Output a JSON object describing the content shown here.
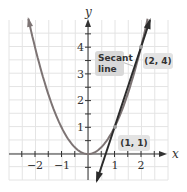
{
  "chart_data": {
    "type": "line",
    "title": "",
    "xlabel": "x",
    "ylabel": "y",
    "xlim": [
      -2.6,
      2.9
    ],
    "ylim": [
      -1.0,
      5.0
    ],
    "x_ticks": [
      -2,
      -1,
      1,
      2
    ],
    "x_tick_labels": [
      "−2",
      "−1",
      "1",
      "2"
    ],
    "y_ticks": [
      1,
      2,
      3,
      4
    ],
    "y_tick_labels": [
      "1",
      "2",
      "3",
      "4"
    ],
    "grid": true,
    "series": [
      {
        "name": "parabola",
        "equation": "y = x^2",
        "x_range": [
          -2.25,
          2.25
        ],
        "color": "#7d7474"
      },
      {
        "name": "secant line",
        "equation": "y = 3x - 2",
        "x_range": [
          0.33,
          2.34
        ],
        "color": "#2b2b2b"
      }
    ],
    "points": [
      {
        "x": 1,
        "y": 1,
        "label": "(1, 1)"
      },
      {
        "x": 2,
        "y": 4,
        "label": "(2, 4)"
      }
    ],
    "annotations": [
      {
        "text": "Secant line",
        "target": "secant line"
      },
      {
        "text": "(2, 4)",
        "target": [
          2,
          4
        ]
      },
      {
        "text": "(1, 1)",
        "target": [
          1,
          1
        ]
      }
    ]
  },
  "labels": {
    "x_axis": "x",
    "y_axis": "y",
    "xt_m2": "−2",
    "xt_m1": "−1",
    "xt_1": "1",
    "xt_2": "2",
    "yt_1": "1",
    "yt_2": "2",
    "yt_3": "3",
    "yt_4": "4",
    "secant_line1": "Secant",
    "secant_line2": "line",
    "pt_24": "(2, 4)",
    "pt_11": "(1, 1)"
  }
}
